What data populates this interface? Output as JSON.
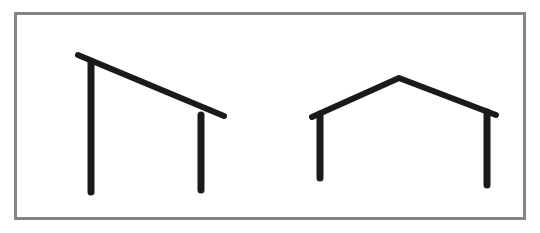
{
  "diagram": {
    "frame_color": "#858585",
    "stroke_color": "#1a1a1a",
    "figures": [
      {
        "name": "lean-to-structure",
        "roof": [
          [
            78,
            55
          ],
          [
            224,
            116
          ]
        ],
        "posts": [
          [
            [
              91,
              62
            ],
            [
              91,
              192
            ]
          ],
          [
            [
              201,
              115
            ],
            [
              201,
              190
            ]
          ]
        ]
      },
      {
        "name": "gable-structure",
        "roof": [
          [
            312,
            117
          ],
          [
            399,
            78
          ],
          [
            496,
            115
          ]
        ],
        "posts": [
          [
            [
              320,
              114
            ],
            [
              320,
              178
            ]
          ],
          [
            [
              487,
              112
            ],
            [
              487,
              185
            ]
          ]
        ]
      }
    ]
  }
}
